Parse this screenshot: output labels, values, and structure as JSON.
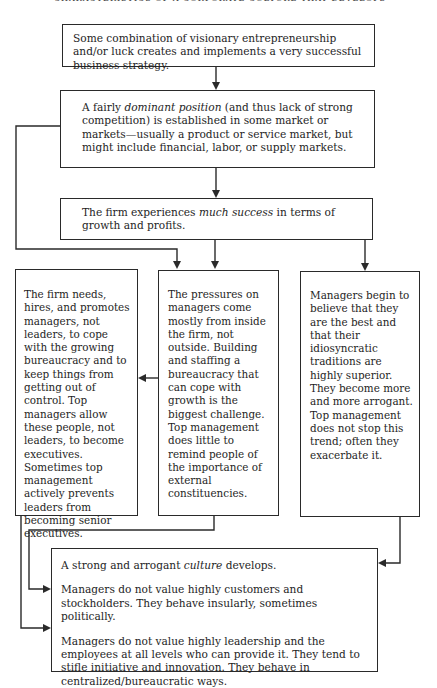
{
  "page": {
    "title_fragment": "CHARACTERISTICS OF A CORPORATE CULTURE THAT DEVELOPS"
  },
  "diagram": {
    "type": "flowchart",
    "nodes": {
      "box1": {
        "text": "Some combination of visionary entrepreneurship and/or luck creates and implements a very successful business strategy."
      },
      "box2": {
        "text_before": "A fairly ",
        "emphasis": "dominant position",
        "text_after": " (and thus lack of strong competition) is established in some market or markets—usually a product or service market, but might include financial, labor, or supply markets."
      },
      "box3": {
        "text_before": "The firm experiences ",
        "emphasis": "much success",
        "text_after": " in terms of growth and profits."
      },
      "left_column": {
        "text": "The firm needs, hires, and promotes managers, not leaders, to cope with the growing bureaucracy and to keep things from getting out of control. Top managers allow these people, not leaders, to become executives. Sometimes top management actively prevents leaders from becoming senior executives."
      },
      "middle_column": {
        "text": "The pressures on managers come mostly from inside the firm, not outside. Building and staffing a bureaucracy that can cope with growth is the biggest challenge. Top management does little to remind people of the importance of external constituencies."
      },
      "right_column": {
        "text": "Managers begin to believe that they are the best and that their idiosyncratic traditions are highly superior. They become more and more arrogant. Top management does not stop this trend; often they exacerbate it."
      },
      "bottom": {
        "line1_before": "A strong and arrogant ",
        "line1_emphasis": "culture",
        "line1_after": " develops.",
        "line2": "Managers do not value highly customers and stockholders. They behave insularly, sometimes politically.",
        "line3": "Managers do not value highly leadership and the employees at all levels who can provide it. They tend to stifle initiative and innovation. They behave in centralized/bureaucratic ways."
      }
    },
    "edges": [
      {
        "from": "box1",
        "to": "box2"
      },
      {
        "from": "box2",
        "to": "box3"
      },
      {
        "from": "box2",
        "to": "middle_column"
      },
      {
        "from": "box3",
        "to": "middle_column"
      },
      {
        "from": "box3",
        "to": "right_column"
      },
      {
        "from": "middle_column",
        "to": "left_column"
      },
      {
        "from": "middle_column",
        "to": "bottom.line2"
      },
      {
        "from": "left_column",
        "to": "bottom.line3"
      },
      {
        "from": "right_column",
        "to": "bottom.line1"
      }
    ],
    "colors": {
      "line": "#2a2a2a",
      "text": "#1e1e1e",
      "background": "#ffffff"
    }
  }
}
